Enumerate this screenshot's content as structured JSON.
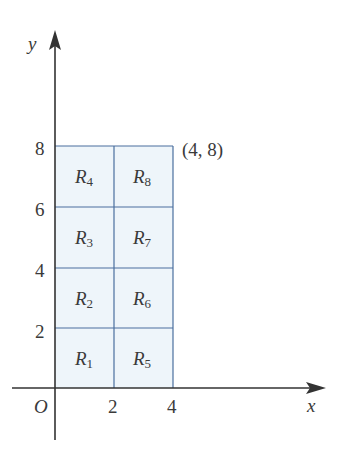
{
  "diagram": {
    "type": "partitioned-rectangle",
    "axes": {
      "x_label": "x",
      "y_label": "y",
      "origin_label": "O",
      "x_ticks": [
        "2",
        "4"
      ],
      "y_ticks": [
        "2",
        "4",
        "6",
        "8"
      ]
    },
    "corner_label": "(4, 8)",
    "regions": [
      {
        "name": "R",
        "sub": "1"
      },
      {
        "name": "R",
        "sub": "2"
      },
      {
        "name": "R",
        "sub": "3"
      },
      {
        "name": "R",
        "sub": "4"
      },
      {
        "name": "R",
        "sub": "5"
      },
      {
        "name": "R",
        "sub": "6"
      },
      {
        "name": "R",
        "sub": "7"
      },
      {
        "name": "R",
        "sub": "8"
      }
    ],
    "colors": {
      "region_fill": "#eef5fa",
      "grid_line": "#4a6f9e",
      "axis": "#333333",
      "text": "#3a3a3a"
    }
  }
}
